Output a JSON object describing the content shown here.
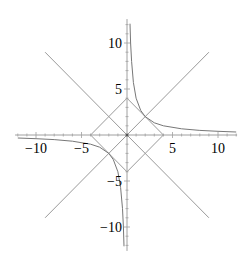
{
  "chart_data": {
    "type": "line",
    "title": "",
    "xlabel": "",
    "ylabel": "",
    "xlim": [
      -12.3,
      12.1
    ],
    "ylim": [
      -12.6,
      12.6
    ],
    "grid": false,
    "legend": null,
    "x_ticks": [
      -10,
      -5,
      5,
      10
    ],
    "y_ticks": [
      10,
      5,
      -5,
      -10
    ],
    "x_tick_labels": [
      "−10",
      "−5",
      "5",
      "10"
    ],
    "y_tick_labels": [
      "10",
      "5",
      "−5",
      "−10"
    ],
    "series": [
      {
        "name": "y = x",
        "kind": "segment",
        "x": [
          -9,
          9
        ],
        "y": [
          -9,
          9
        ],
        "color": "#9a9a9a"
      },
      {
        "name": "y = -x",
        "kind": "segment",
        "x": [
          -9,
          9
        ],
        "y": [
          9,
          -9
        ],
        "color": "#9a9a9a"
      },
      {
        "name": "|x| + |y| = 4",
        "kind": "polygon",
        "x": [
          4,
          0,
          -4,
          0,
          4
        ],
        "y": [
          0,
          4,
          0,
          -4,
          0
        ],
        "color": "#9a9a9a"
      },
      {
        "name": "y = 4/x (x>0)",
        "kind": "curve",
        "x": [
          0.33,
          0.4,
          0.5,
          0.7,
          1,
          1.5,
          2,
          3,
          4,
          6,
          8,
          10,
          12
        ],
        "y": [
          12.1,
          10,
          8,
          5.71,
          4,
          2.67,
          2,
          1.33,
          1,
          0.67,
          0.5,
          0.4,
          0.33
        ],
        "color": "#777777"
      },
      {
        "name": "y = 4/x (x<0)",
        "kind": "curve",
        "x": [
          -12,
          -10,
          -8,
          -6,
          -4,
          -3,
          -2,
          -1.5,
          -1,
          -0.7,
          -0.5,
          -0.4,
          -0.33
        ],
        "y": [
          -0.33,
          -0.4,
          -0.5,
          -0.67,
          -1,
          -1.33,
          -2,
          -2.67,
          -4,
          -5.71,
          -8,
          -10,
          -12.1
        ],
        "color": "#777777"
      }
    ]
  },
  "axes": {
    "color": "#a0a0a0",
    "origin_px": [
      127,
      135
    ],
    "scale_px_per_unit": [
      9.1,
      9.2
    ]
  }
}
